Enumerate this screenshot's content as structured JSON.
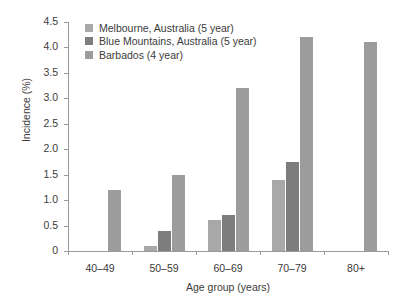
{
  "chart_data": {
    "type": "bar",
    "title": "",
    "xlabel": "Age group (years)",
    "ylabel": "Incidence (%)",
    "categories": [
      "40–49",
      "50–59",
      "60–69",
      "70–79",
      "80+"
    ],
    "ylim": [
      0,
      4.5
    ],
    "yticks": [
      "0",
      "0.5",
      "1.0",
      "1.5",
      "2.0",
      "2.5",
      "3.0",
      "3.5",
      "4.0",
      "4.5"
    ],
    "ytick_values": [
      0,
      0.5,
      1.0,
      1.5,
      2.0,
      2.5,
      3.0,
      3.5,
      4.0,
      4.5
    ],
    "grid": false,
    "legend_position": "top-left",
    "series": [
      {
        "name": "Melbourne, Australia (5 year)",
        "color": "#a8a8a8",
        "values": [
          null,
          0.1,
          0.6,
          1.4,
          null
        ]
      },
      {
        "name": "Blue Mountains, Australia (5 year)",
        "color": "#7d7d7d",
        "values": [
          null,
          0.4,
          0.7,
          1.75,
          null
        ]
      },
      {
        "name": "Barbados (4 year)",
        "color": "#9c9c9c",
        "values": [
          1.2,
          1.5,
          3.2,
          4.2,
          4.1
        ]
      }
    ]
  },
  "legend": {
    "items": [
      {
        "label": "Melbourne, Australia (5 year)",
        "color": "#a8a8a8"
      },
      {
        "label": "Blue Mountains, Australia (5 year)",
        "color": "#7d7d7d"
      },
      {
        "label": "Barbados (4 year)",
        "color": "#9c9c9c"
      }
    ]
  },
  "axes": {
    "y_title": "Incidence (%)",
    "x_title": "Age group (years)"
  }
}
